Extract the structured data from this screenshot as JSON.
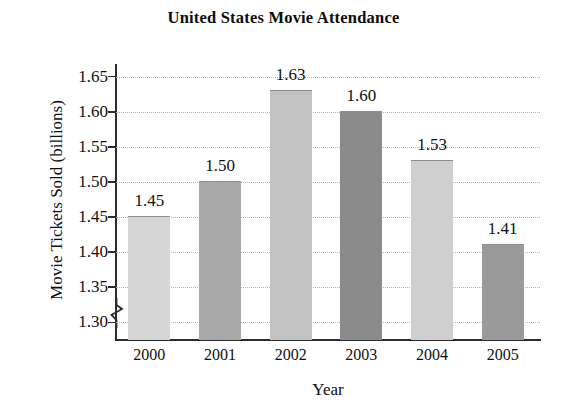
{
  "chart_data": {
    "type": "bar",
    "title": "United States Movie Attendance",
    "xlabel": "Year",
    "ylabel": "Movie Tickets Sold (billions)",
    "categories": [
      "2000",
      "2001",
      "2002",
      "2003",
      "2004",
      "2005"
    ],
    "values": [
      1.45,
      1.5,
      1.63,
      1.6,
      1.53,
      1.41
    ],
    "value_labels": [
      "1.45",
      "1.50",
      "1.63",
      "1.60",
      "1.53",
      "1.41"
    ],
    "ylim": [
      1.275,
      1.665
    ],
    "yticks": [
      1.65,
      1.6,
      1.55,
      1.5,
      1.45,
      1.4,
      1.35,
      1.3
    ],
    "ytick_labels": [
      "1.65",
      "1.60",
      "1.55",
      "1.50",
      "1.45",
      "1.40",
      "1.35",
      "1.30"
    ],
    "grid": true,
    "grid_axis": "y",
    "grid_style": "dotted",
    "legend": "none",
    "axis_break": true,
    "axis_break_note": "y-axis broken below 1.30",
    "bar_colors": [
      "#d6d6d6",
      "#a9a9a9",
      "#c2c2c2",
      "#8b8b8b",
      "#cfcfcf",
      "#9a9a9a"
    ],
    "bar_border_color": "#8f8f8f",
    "axis_color": "#2b2b2b",
    "gridline_color": "#b4b4b4",
    "background": "#ffffff",
    "text_color": "#101010"
  }
}
